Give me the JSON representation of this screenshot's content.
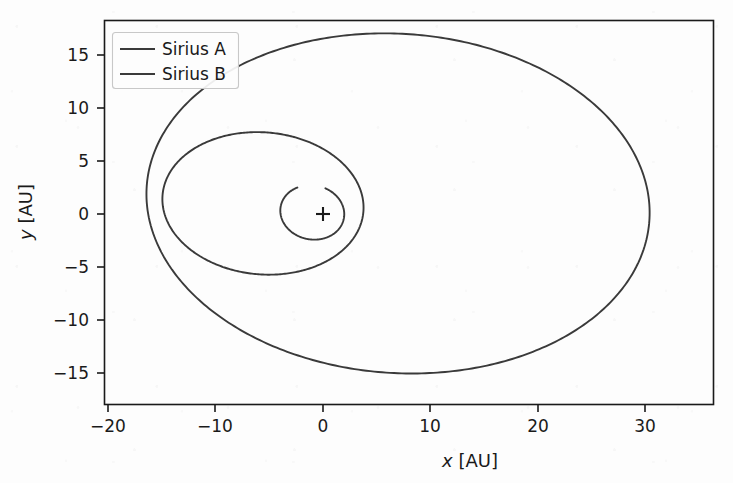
{
  "chart_data": {
    "type": "line",
    "title": "",
    "xlabel": "x [AU]",
    "ylabel": "y [AU]",
    "xlabel_var": "x",
    "xlabel_unit": " [AU]",
    "ylabel_var": "y",
    "ylabel_unit": " [AU]",
    "xlim": [
      -22.5,
      35.5
    ],
    "ylim": [
      -18.5,
      18.0
    ],
    "xticks": [
      -20,
      -10,
      0,
      10,
      20,
      30
    ],
    "xtick_labels": [
      "−20",
      "−10",
      "0",
      "10",
      "20",
      "30"
    ],
    "yticks": [
      15,
      10,
      5,
      0,
      -5,
      -10,
      -15
    ],
    "ytick_labels": [
      "15",
      "10",
      "5",
      "0",
      "−5",
      "−10",
      "−15"
    ],
    "grid": false,
    "legend_position": "upper left",
    "center_marker": {
      "symbol": "+",
      "x": 0,
      "y": 0,
      "label": "center-of-mass"
    },
    "series": [
      {
        "name": "Sirius A",
        "color": "#3a3a3a",
        "linewidth": 1.8,
        "orbit": {
          "shape": "ellipse",
          "semi_major_au": 3.0,
          "semi_minor_au": 2.55,
          "center_x_au": -1.0,
          "center_y_au": 0.15,
          "rotation_deg": -12,
          "open_gap_deg": 52,
          "gap_start_deg": 128
        }
      },
      {
        "name": "Sirius B",
        "color": "#3a3a3a",
        "linewidth": 1.8,
        "orbits": [
          {
            "shape": "ellipse",
            "note": "inner smaller loop",
            "semi_major_au": 9.4,
            "semi_minor_au": 6.7,
            "center_x_au": -5.6,
            "center_y_au": 1.0,
            "rotation_deg": -5
          },
          {
            "shape": "ellipse",
            "note": "outer larger loop",
            "semi_major_au": 23.5,
            "semi_minor_au": 16.0,
            "center_x_au": 7.0,
            "center_y_au": 1.0,
            "rotation_deg": -4
          }
        ]
      }
    ],
    "annotations": []
  },
  "legend": {
    "entries": [
      {
        "label": "Sirius A",
        "color": "#3a3a3a"
      },
      {
        "label": "Sirius B",
        "color": "#3a3a3a"
      }
    ]
  },
  "axes": {
    "spine_color": "#1a1a1a",
    "background_color": "#fdfdfd"
  }
}
